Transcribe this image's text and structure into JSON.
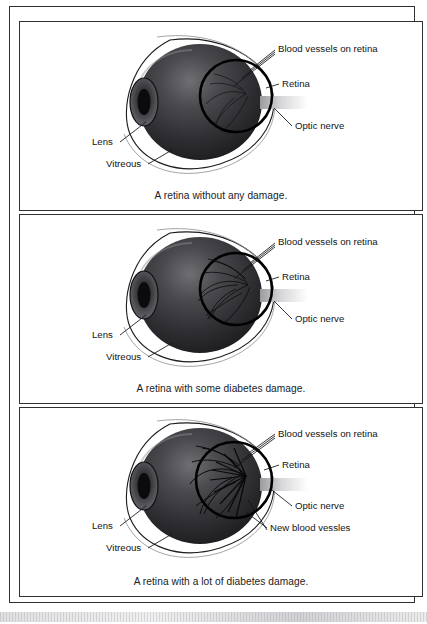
{
  "figure": {
    "panel_count": 3,
    "colors": {
      "frame": "#2e3033",
      "text": "#121316",
      "sclera_outline": "#1b1c1e",
      "vitreous_dark": "#2b2b2e",
      "retina_ring": "#000000",
      "optic_nerve": "#bdbdc0"
    }
  },
  "panels": [
    {
      "id": "panel-normal",
      "caption": "A retina without any damage.",
      "severity": "none",
      "vessel_density": 1,
      "labels": [
        {
          "name": "blood-vessels-on-retina",
          "text": "Blood vessels on retina",
          "x": 258,
          "y": 26
        },
        {
          "name": "retina",
          "text": "Retina",
          "x": 262,
          "y": 62
        },
        {
          "name": "optic-nerve",
          "text": "Optic nerve",
          "x": 275,
          "y": 104
        },
        {
          "name": "lens",
          "text": "Lens",
          "x": 78,
          "y": 120
        },
        {
          "name": "vitreous",
          "text": "Vitreous",
          "x": 92,
          "y": 142
        }
      ]
    },
    {
      "id": "panel-some-damage",
      "caption": "A retina with some diabetes damage.",
      "severity": "some",
      "vessel_density": 2,
      "labels": [
        {
          "name": "blood-vessels-on-retina",
          "text": "Blood vessels on retina",
          "x": 258,
          "y": 26
        },
        {
          "name": "retina",
          "text": "Retina",
          "x": 262,
          "y": 62
        },
        {
          "name": "optic-nerve",
          "text": "Optic nerve",
          "x": 275,
          "y": 104
        },
        {
          "name": "lens",
          "text": "Lens",
          "x": 78,
          "y": 120
        },
        {
          "name": "vitreous",
          "text": "Vitreous",
          "x": 92,
          "y": 142
        }
      ]
    },
    {
      "id": "panel-lot-damage",
      "caption": "A retina with a lot of diabetes damage.",
      "severity": "severe",
      "vessel_density": 3,
      "labels": [
        {
          "name": "blood-vessels-on-retina",
          "text": "Blood vessels on retina",
          "x": 258,
          "y": 26
        },
        {
          "name": "retina",
          "text": "Retina",
          "x": 262,
          "y": 57
        },
        {
          "name": "optic-nerve",
          "text": "Optic nerve",
          "x": 275,
          "y": 98
        },
        {
          "name": "new-blood-vessels",
          "text": "New blood vessles",
          "x": 250,
          "y": 120
        },
        {
          "name": "lens",
          "text": "Lens",
          "x": 78,
          "y": 118
        },
        {
          "name": "vitreous",
          "text": "Vitreous",
          "x": 92,
          "y": 140
        }
      ]
    }
  ]
}
